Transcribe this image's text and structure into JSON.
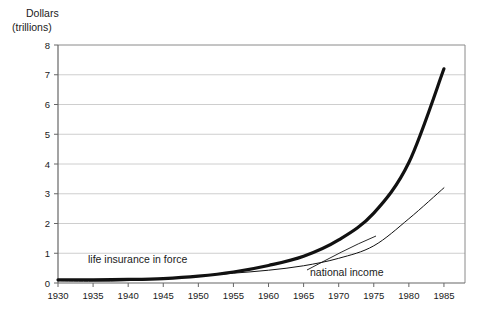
{
  "axis_title": {
    "line1": "Dollars",
    "line2": "(trillions)"
  },
  "labels": {
    "life_insurance": "life insurance in force",
    "national_income": "national income"
  },
  "chart_data": {
    "type": "line",
    "title": "",
    "subtitle": "",
    "xlabel": "",
    "ylabel": "Dollars (trillions)",
    "xlim": [
      1930,
      1988
    ],
    "ylim": [
      0,
      8
    ],
    "ytick_step": 1,
    "yticks": [
      0,
      1,
      2,
      3,
      4,
      5,
      6,
      7,
      8
    ],
    "xticks": [
      1930,
      1935,
      1940,
      1945,
      1950,
      1955,
      1960,
      1965,
      1970,
      1975,
      1980,
      1985
    ],
    "grid": "horizontal",
    "grid_color": "#c8c8c8",
    "legend_position": "inline-annotation",
    "x": [
      1930,
      1935,
      1940,
      1945,
      1950,
      1955,
      1960,
      1965,
      1970,
      1975,
      1980,
      1985
    ],
    "series": [
      {
        "name": "life insurance in force",
        "color": "#111111",
        "line_width": 3.2,
        "values": [
          0.11,
          0.11,
          0.12,
          0.15,
          0.23,
          0.37,
          0.59,
          0.9,
          1.45,
          2.35,
          4.05,
          7.2
        ]
      },
      {
        "name": "national income",
        "color": "#111111",
        "line_width": 1.0,
        "values": [
          0.07,
          0.06,
          0.08,
          0.15,
          0.24,
          0.33,
          0.43,
          0.58,
          0.83,
          1.25,
          2.16,
          3.2
        ]
      }
    ]
  }
}
